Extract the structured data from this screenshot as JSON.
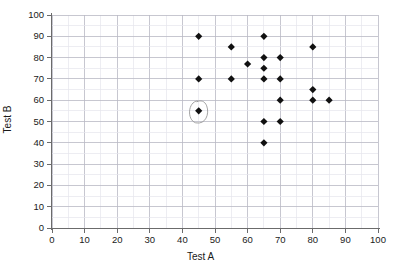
{
  "chart_data": {
    "type": "scatter",
    "title": "",
    "xlabel": "Test A",
    "ylabel": "Test B",
    "xlim": [
      0,
      100
    ],
    "ylim": [
      0,
      100
    ],
    "xticks": [
      0,
      10,
      20,
      30,
      40,
      50,
      60,
      70,
      80,
      90,
      100
    ],
    "yticks": [
      0,
      10,
      20,
      30,
      40,
      50,
      60,
      70,
      80,
      90,
      100
    ],
    "grid": true,
    "grid_major_step": 10,
    "grid_minor_step": 5,
    "legend": "none",
    "marker": "diamond",
    "marker_color": "#111111",
    "points": [
      {
        "x": 45,
        "y": 90
      },
      {
        "x": 45,
        "y": 70
      },
      {
        "x": 45,
        "y": 55,
        "annotation": "circled"
      },
      {
        "x": 55,
        "y": 85
      },
      {
        "x": 55,
        "y": 70
      },
      {
        "x": 60,
        "y": 77
      },
      {
        "x": 65,
        "y": 90
      },
      {
        "x": 65,
        "y": 80
      },
      {
        "x": 65,
        "y": 75
      },
      {
        "x": 65,
        "y": 70
      },
      {
        "x": 65,
        "y": 50
      },
      {
        "x": 65,
        "y": 40
      },
      {
        "x": 70,
        "y": 80
      },
      {
        "x": 70,
        "y": 70
      },
      {
        "x": 70,
        "y": 60
      },
      {
        "x": 70,
        "y": 50
      },
      {
        "x": 80,
        "y": 85
      },
      {
        "x": 80,
        "y": 65
      },
      {
        "x": 80,
        "y": 60
      },
      {
        "x": 85,
        "y": 60
      }
    ],
    "annotations": [
      {
        "type": "hand-drawn-ellipse",
        "target_point": {
          "x": 45,
          "y": 55
        },
        "color": "#9a9a9a"
      }
    ]
  },
  "colors": {
    "axis": "#6b6b6b",
    "grid_major": "#b9b9c4",
    "grid_minor": "#e6e6ec",
    "marker": "#111111",
    "text": "#1a1a1a",
    "background": "#ffffff"
  }
}
